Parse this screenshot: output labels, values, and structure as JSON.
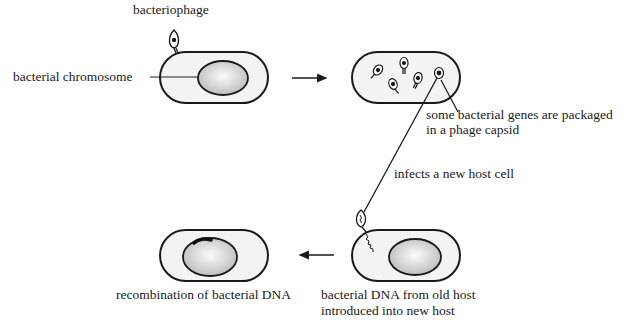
{
  "labels": {
    "bacteriophage": "bacteriophage",
    "bacterial_chromosome": "bacterial chromosome",
    "packaged_line1": "some bacterial genes are packaged",
    "packaged_line2": "in a phage capsid",
    "infects": "infects a new host cell",
    "introduced_line1": "bacterial DNA from old host",
    "introduced_line2": "introduced into new host",
    "recombination": "recombination of bacterial DNA"
  },
  "steps": [
    {
      "id": "infection",
      "label": "bacteriophage attaches to bacterium"
    },
    {
      "id": "packaging",
      "label": "some bacterial genes are packaged in a phage capsid"
    },
    {
      "id": "new-host",
      "label": "bacterial DNA from old host introduced into new host"
    },
    {
      "id": "recombination",
      "label": "recombination of bacterial DNA"
    }
  ],
  "colors": {
    "stroke": "#1a1a1a",
    "cell_fill": "#f3f3f3",
    "nucleoid_fill_center": "#fafafa",
    "nucleoid_fill_edge": "#bdbdbd",
    "recombination_mark": "#111111"
  }
}
